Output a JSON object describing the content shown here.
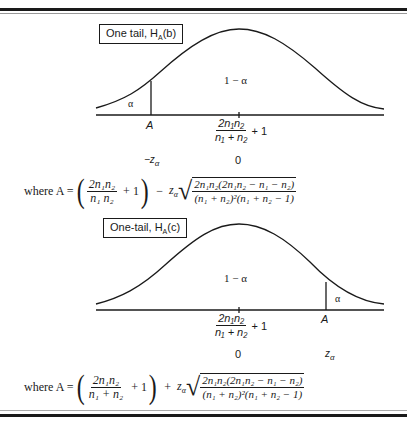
{
  "panel_b": {
    "title": "One tail, H",
    "title_sub": "A",
    "title_suffix": "(b)",
    "center_region_label": "1 − α",
    "tail_label": "α",
    "critical_point_label": "A",
    "mean_numerator": "2n₁n₂",
    "mean_denominator": "n₁ + n₂",
    "mean_plus": "+ 1",
    "z_critical_label": "−z",
    "z_critical_sub": "α",
    "z_center_label": "0",
    "formula_prefix": "where A =",
    "formula_frac_num": "2n₁n₂",
    "formula_frac_den": "n₁ n₂",
    "formula_plus_one": "+ 1",
    "formula_sign": "−",
    "formula_z": "z",
    "formula_z_sub": "α",
    "formula_sqrt_num": "2n₁n₂(2n₁n₂ − n₁ − n₂)",
    "formula_sqrt_den": "(n₁ + n₂)²(n₁ + n₂ − 1)"
  },
  "panel_c": {
    "title": "One-tail, H",
    "title_sub": "A",
    "title_suffix": "(c)",
    "center_region_label": "1 − α",
    "tail_label": "α",
    "critical_point_label": "A",
    "mean_numerator": "2n₁n₂",
    "mean_denominator": "n₁ + n₂",
    "mean_plus": "+ 1",
    "z_critical_label": "z",
    "z_critical_sub": "α",
    "z_center_label": "0",
    "formula_prefix": "where A =",
    "formula_frac_num": "2n₁n₂",
    "formula_frac_den": "n₁ + n₂",
    "formula_plus_one": "+ 1",
    "formula_sign": "+",
    "formula_z": "z",
    "formula_z_sub": "α",
    "formula_sqrt_num": "2n₁n₂(2n₁n₂ − n₁ − n₂)",
    "formula_sqrt_den": "(n₁ + n₂)²(n₁ + n₂ − 1)"
  }
}
